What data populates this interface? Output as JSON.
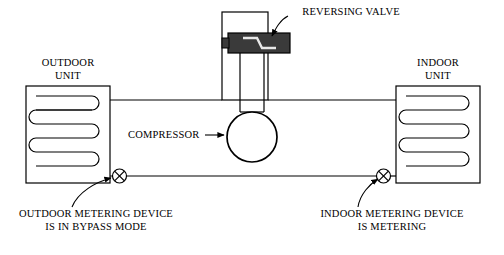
{
  "diagram": {
    "background": "#ffffff",
    "line_color": "#000000",
    "labels": {
      "reversing_valve": "REVERSING VALVE",
      "outdoor_unit": "OUTDOOR\nUNIT",
      "indoor_unit": "INDOOR\nUNIT",
      "compressor": "COMPRESSOR",
      "outdoor_metering": "OUTDOOR METERING DEVICE\nIS IN BYPASS MODE",
      "indoor_metering": "INDOOR METERING DEVICE\nIS METERING"
    },
    "components": {
      "outdoor_coil": {
        "name": "outdoor-coil",
        "passes": 4
      },
      "indoor_coil": {
        "name": "indoor-coil",
        "passes": 4
      },
      "compressor": {
        "name": "compressor-circle"
      },
      "reversing_valve": {
        "name": "reversing-valve-body",
        "fill": "#3a3a3a"
      },
      "outdoor_metering_device": {
        "name": "outdoor-metering-device",
        "symbol": "crossed-circle"
      },
      "indoor_metering_device": {
        "name": "indoor-metering-device",
        "symbol": "crossed-circle"
      }
    }
  }
}
